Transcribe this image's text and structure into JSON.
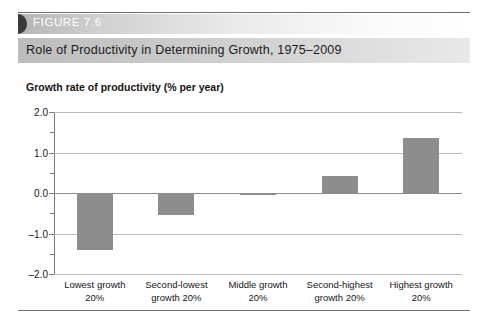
{
  "figure": {
    "number_label": "FIGURE 7.6",
    "title": "Role of Productivity in Determining Growth, 1975–2009"
  },
  "colors": {
    "bar": "#8d8d8d",
    "gridline": "#b9b9b9",
    "zero_line": "#8c8c8c",
    "axis": "#7a7a7a",
    "rule": "#6f6f6f",
    "banner_text": "#ffffff",
    "text": "#161616"
  },
  "chart_data": {
    "type": "bar",
    "title": "Role of Productivity in Determining Growth, 1975–2009",
    "subtitle": "",
    "xlabel": "",
    "ylabel": "Growth rate of productivity (% per year)",
    "categories": [
      "Lowest growth 20%",
      "Second-lowest growth 20%",
      "Middle growth 20%",
      "Second-highest growth 20%",
      "Highest growth 20%"
    ],
    "category_lines": [
      [
        "Lowest growth",
        "20%"
      ],
      [
        "Second-lowest",
        "growth 20%"
      ],
      [
        "Middle growth",
        "20%"
      ],
      [
        "Second-highest",
        "growth 20%"
      ],
      [
        "Highest growth",
        "20%"
      ]
    ],
    "values": [
      -1.4,
      -0.55,
      -0.03,
      0.42,
      1.35
    ],
    "ylim": [
      -2.0,
      2.0
    ],
    "ytick_labels": [
      "2.0",
      "1.0",
      "0.0",
      "–1.0",
      "–2.0"
    ],
    "ytick_values": [
      2.0,
      1.0,
      0.0,
      -1.0,
      -2.0
    ],
    "yminor_ticks": [
      1.5,
      0.5,
      -0.5,
      -1.5
    ],
    "grid": true,
    "legend": "none"
  }
}
